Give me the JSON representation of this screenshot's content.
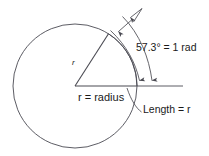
{
  "figure": {
    "colors": {
      "stroke": "#4a4a52",
      "text": "#1a1a1a",
      "background": "#ffffff"
    },
    "labels": {
      "radius_mark": "r",
      "radius_baseline": "r = radius",
      "angle": "57.3° = 1 rad",
      "arc_length": "Length = r"
    },
    "geometry": {
      "center_x": 75,
      "center_y": 86,
      "radius": 62,
      "angle_degrees": 57.3,
      "angle_radians": 1,
      "baseline_end_x": 137,
      "baseline_end_y": 86,
      "slant_end_x": 108.5,
      "slant_end_y": 33.8
    },
    "icons": {
      "arrowhead": "arrowhead-icon",
      "arc": "arc-icon"
    }
  }
}
